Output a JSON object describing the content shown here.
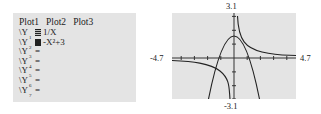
{
  "y_editor": {
    "plots": [
      "Plot1",
      "Plot2",
      "Plot3"
    ],
    "equations": [
      {
        "name": "\\Y",
        "index": "1",
        "selected": true,
        "style": "striped",
        "expr": "1/X"
      },
      {
        "name": "\\Y",
        "index": "2",
        "selected": true,
        "style": "solid",
        "expr": "-X²+3"
      },
      {
        "name": "\\Y",
        "index": "3",
        "selected": false,
        "expr": "="
      },
      {
        "name": "\\Y",
        "index": "4",
        "selected": false,
        "expr": "="
      },
      {
        "name": "\\Y",
        "index": "5",
        "selected": false,
        "expr": "="
      },
      {
        "name": "\\Y",
        "index": "6",
        "selected": false,
        "expr": "="
      },
      {
        "name": "\\Y",
        "index": "7",
        "selected": false,
        "expr": "="
      }
    ]
  },
  "graph": {
    "ymax_label": "3.1",
    "ymin_label": "-3.1",
    "xmin_label": "-4.7",
    "xmax_label": "4.7",
    "window": {
      "xmin": -4.7,
      "xmax": 4.7,
      "ymin": -3.1,
      "ymax": 3.1,
      "xscl": 1,
      "yscl": 1
    },
    "functions": [
      "1/X",
      "-X^2+3"
    ],
    "background": "#e4e4e4",
    "curve_color": "#222222"
  }
}
